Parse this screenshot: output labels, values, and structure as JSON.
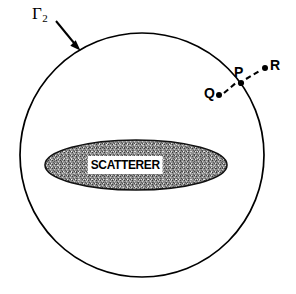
{
  "figure": {
    "type": "scattering-geometry-diagram",
    "background_color": "#ffffff",
    "stroke_color": "#000000",
    "scatterer_fill_color": "#9a9a9a"
  },
  "boundary": {
    "label": "Γ",
    "subscript": "2",
    "name": "Gamma-2 enclosing circle",
    "center": {
      "x": 142,
      "y": 155
    },
    "radius": 122
  },
  "arrow": {
    "name": "gamma-2-pointer",
    "from": {
      "x": 56,
      "y": 21
    },
    "to": {
      "x": 79,
      "y": 49
    }
  },
  "scatterer": {
    "label": "SCATTERER",
    "center": {
      "x": 136,
      "y": 165
    },
    "rx": 91,
    "ry": 25
  },
  "points": [
    {
      "id": "P",
      "label": "P",
      "x": 241,
      "y": 83,
      "label_x": 234,
      "label_y": 65
    },
    {
      "id": "Q",
      "label": "Q",
      "x": 219,
      "y": 95,
      "label_x": 204,
      "label_y": 86
    },
    {
      "id": "R",
      "label": "R",
      "x": 265,
      "y": 68,
      "label_x": 270,
      "label_y": 58
    }
  ],
  "connections": [
    {
      "from": "Q",
      "to": "P",
      "style": "dashed"
    },
    {
      "from": "P",
      "to": "R",
      "style": "dashed"
    }
  ]
}
